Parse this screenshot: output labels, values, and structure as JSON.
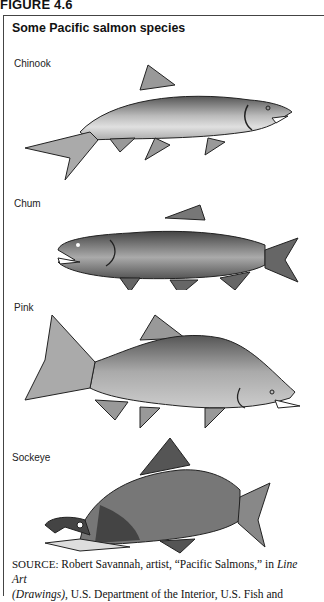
{
  "figure": {
    "number_label": "FIGURE 4.6",
    "title": "Some Pacific salmon species"
  },
  "species": [
    {
      "name": "Chinook",
      "icon": "chinook-salmon-illustration"
    },
    {
      "name": "Chum",
      "icon": "chum-salmon-illustration"
    },
    {
      "name": "Pink",
      "icon": "pink-salmon-illustration"
    },
    {
      "name": "Sockeye",
      "icon": "sockeye-salmon-illustration"
    }
  ],
  "source": {
    "label": "SOURCE:",
    "text_1": " Robert Savannah, artist, “Pacific Salmons,” in ",
    "italic_1": "Line Art",
    "italic_2": "(Drawings)",
    "text_2": ", U.S. Department of the Interior, U.S. Fish and"
  },
  "colors": {
    "border": "#444444",
    "fish_light": "#c8c8c8",
    "fish_mid": "#8a8a8a",
    "fish_dark": "#4a4a4a"
  }
}
